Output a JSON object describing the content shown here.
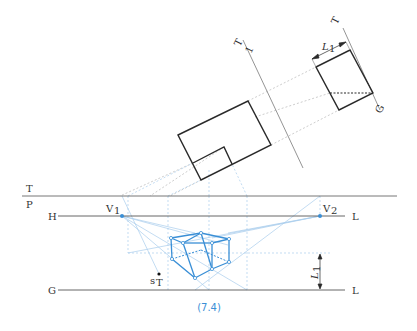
{
  "figure": {
    "caption": "(7.4)",
    "colors": {
      "ink": "#2a2a2a",
      "construction": "#b0b0b0",
      "blue": "#3a8fd6",
      "blue_light": "#a9cdec"
    }
  },
  "labels": {
    "T": "T",
    "P": "P",
    "H": "H",
    "L_horizon": "L",
    "G": "G",
    "L_ground": "L",
    "V1": "V",
    "V1_sub": "1",
    "V2": "V",
    "V2_sub": "2",
    "sT": "s",
    "sT_sub": "T",
    "L1_dim_bottom": "L",
    "L1_dim_bottom_sub": "1",
    "L1_dim_top": "L",
    "L1_dim_top_sub": "1",
    "plan_line_T": "T",
    "plan_line_1": "1",
    "side_line_T": "T",
    "side_line_G": "G"
  }
}
